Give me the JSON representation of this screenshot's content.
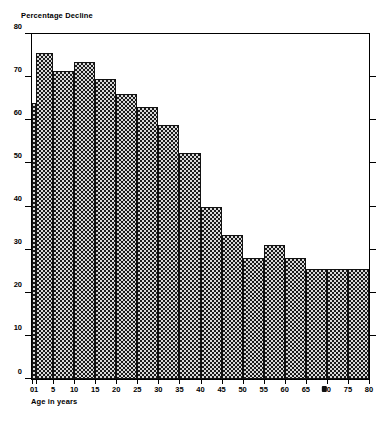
{
  "chart_data": {
    "type": "bar",
    "title": "",
    "ylabel": "Percentage Decline",
    "xlabel": "Age in years",
    "ylim": [
      0,
      80
    ],
    "xlim": [
      0,
      80
    ],
    "grid": false,
    "legend": null,
    "y_ticks": [
      0,
      10,
      20,
      30,
      40,
      50,
      60,
      70,
      80
    ],
    "x_ticks": [
      0,
      1,
      5,
      10,
      15,
      20,
      25,
      30,
      35,
      40,
      45,
      50,
      55,
      60,
      65,
      70,
      75,
      80
    ],
    "x_tick_labels": [
      "0",
      "1",
      "5",
      "10",
      "15",
      "20",
      "25",
      "30",
      "35",
      "40",
      "45",
      "50",
      "55",
      "60",
      "65",
      "70",
      "75",
      "80"
    ],
    "bins": [
      {
        "label": "0-1",
        "x0": 0,
        "x1": 1,
        "value": 64
      },
      {
        "label": "1-5",
        "x0": 1,
        "x1": 5,
        "value": 75.5
      },
      {
        "label": "5-10",
        "x0": 5,
        "x1": 10,
        "value": 71.5
      },
      {
        "label": "10-15",
        "x0": 10,
        "x1": 15,
        "value": 73.5
      },
      {
        "label": "15-20",
        "x0": 15,
        "x1": 20,
        "value": 69.5
      },
      {
        "label": "20-25",
        "x0": 20,
        "x1": 25,
        "value": 66
      },
      {
        "label": "25-30",
        "x0": 25,
        "x1": 30,
        "value": 63
      },
      {
        "label": "30-35",
        "x0": 30,
        "x1": 35,
        "value": 59
      },
      {
        "label": "35-40",
        "x0": 35,
        "x1": 40,
        "value": 52.5
      },
      {
        "label": "40-45",
        "x0": 40,
        "x1": 45,
        "value": 40
      },
      {
        "label": "45-50",
        "x0": 45,
        "x1": 50,
        "value": 33.5
      },
      {
        "label": "50-55",
        "x0": 50,
        "x1": 55,
        "value": 28
      },
      {
        "label": "55-60",
        "x0": 55,
        "x1": 60,
        "value": 31
      },
      {
        "label": "60-65",
        "x0": 60,
        "x1": 65,
        "value": 28
      },
      {
        "label": "65-70",
        "x0": 65,
        "x1": 70,
        "value": 25.5
      },
      {
        "label": "70-75",
        "x0": 70,
        "x1": 75,
        "value": 25.5
      },
      {
        "label": "75-80",
        "x0": 75,
        "x1": 80,
        "value": 25.5
      }
    ]
  }
}
